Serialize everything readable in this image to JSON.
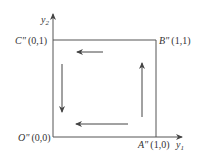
{
  "diagram": {
    "type": "coordinate-square-traversal",
    "axes": {
      "x_label": "y",
      "x_subscript": "1",
      "y_label": "y",
      "y_subscript": "2"
    },
    "points": [
      {
        "name": "O\"",
        "coords": "(0,0)"
      },
      {
        "name": "A\"",
        "coords": "(1,0)"
      },
      {
        "name": "B\"",
        "coords": "(1,1)"
      },
      {
        "name": "C\"",
        "coords": "(0,1)"
      }
    ],
    "arrows": [
      {
        "side": "top",
        "direction": "left"
      },
      {
        "side": "left",
        "direction": "down"
      },
      {
        "side": "bottom",
        "direction": "left"
      },
      {
        "side": "right",
        "direction": "up"
      }
    ],
    "colors": {
      "line": "#555555",
      "text": "#333333"
    }
  }
}
